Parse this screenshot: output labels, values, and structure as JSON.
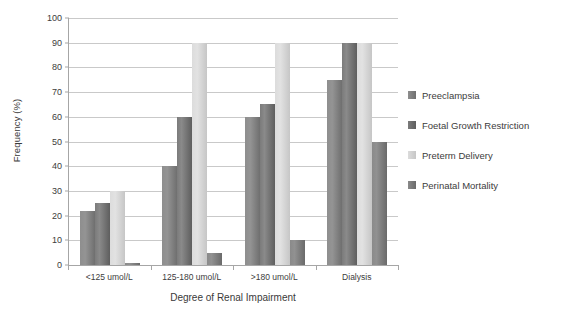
{
  "chart_data": {
    "type": "bar",
    "title": "",
    "xlabel": "Degree of Renal Impairment",
    "ylabel": "Frequency (%)",
    "ylim": [
      0,
      100
    ],
    "ytick_step": 10,
    "yticks": [
      100,
      90,
      80,
      70,
      60,
      50,
      40,
      30,
      20,
      10,
      0
    ],
    "grid": true,
    "legend_position": "right",
    "categories": [
      "<125 umol/L",
      "125-180 umol/L",
      ">180 umol/L",
      "Dialysis"
    ],
    "series": [
      {
        "name": "Preeclampsia",
        "color": "#8e8e8e",
        "values": [
          22,
          40,
          60,
          75
        ]
      },
      {
        "name": "Foetal Growth Restriction",
        "color": "#7b7b7b",
        "values": [
          25,
          60,
          65,
          90
        ]
      },
      {
        "name": "Preterm Delivery",
        "color": "#dcdcdc",
        "values": [
          30,
          90,
          90,
          90
        ]
      },
      {
        "name": "Perinatal Mortality",
        "color": "#8a8a8a",
        "values": [
          1,
          5,
          10,
          50
        ]
      }
    ]
  }
}
